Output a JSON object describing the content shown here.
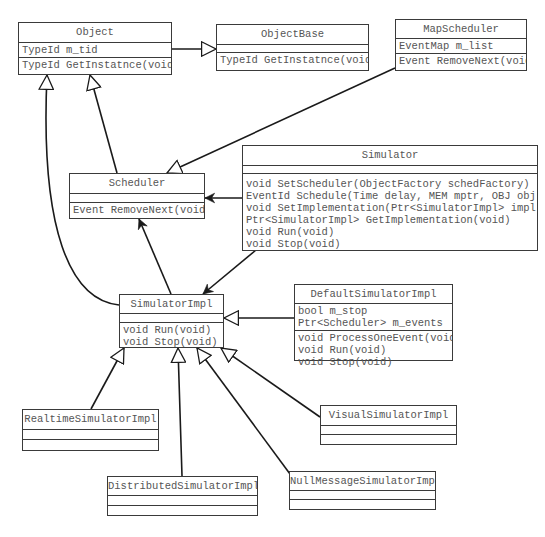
{
  "diagram": {
    "type": "UML class diagram",
    "top_cutoff_text": "",
    "classes": {
      "object": {
        "name": "Object",
        "attributes": [
          "TypeId m_tid"
        ],
        "methods": [
          "TypeId GetInstatnce(void)"
        ]
      },
      "object_base": {
        "name": "ObjectBase",
        "attributes": [],
        "methods": [
          "TypeId GetInstatnce(void)"
        ]
      },
      "map_scheduler": {
        "name": "MapScheduler",
        "attributes": [
          "EventMap m_list"
        ],
        "methods": [
          "Event RemoveNext(void)"
        ]
      },
      "scheduler": {
        "name": "Scheduler",
        "attributes": [],
        "methods": [
          "Event RemoveNext(void)"
        ]
      },
      "simulator": {
        "name": "Simulator",
        "attributes": [],
        "methods": [
          "void SetScheduler(ObjectFactory schedFactory)",
          "EventId Schedule(Time delay, MEM mptr, OBJ obj)",
          "void SetImplementation(Ptr<SimulatorImpl> impl)",
          "Ptr<SimulatorImpl> GetImplementation(void)",
          "void Run(void)",
          "void Stop(void)"
        ]
      },
      "simulator_impl": {
        "name": "SimulatorImpl",
        "attributes": [],
        "methods": [
          "void Run(void)",
          "void Stop(void)"
        ]
      },
      "default_simulator_impl": {
        "name": "DefaultSimulatorImpl",
        "attributes": [
          "bool m_stop",
          "Ptr<Scheduler> m_events"
        ],
        "methods": [
          "void ProcessOneEvent(void)",
          "void Run(void)",
          "void Stop(void)"
        ]
      },
      "realtime_simulator_impl": {
        "name": "RealtimeSimulatorImpl",
        "attributes": [],
        "methods": []
      },
      "visual_simulator_impl": {
        "name": "VisualSimulatorImpl",
        "attributes": [],
        "methods": []
      },
      "distributed_simulator_impl": {
        "name": "DistributedSimulatorImpl",
        "attributes": [],
        "methods": []
      },
      "null_message_simulator_impl": {
        "name": "NullMessageSimulatorImpl",
        "attributes": [],
        "methods": []
      }
    },
    "relations": [
      {
        "from": "Object",
        "to": "ObjectBase",
        "kind": "generalization"
      },
      {
        "from": "Scheduler",
        "to": "Object",
        "kind": "generalization"
      },
      {
        "from": "SimulatorImpl",
        "to": "Object",
        "kind": "generalization"
      },
      {
        "from": "MapScheduler",
        "to": "Scheduler",
        "kind": "generalization"
      },
      {
        "from": "Simulator",
        "to": "Scheduler",
        "kind": "association"
      },
      {
        "from": "Simulator",
        "to": "SimulatorImpl",
        "kind": "association"
      },
      {
        "from": "SimulatorImpl",
        "to": "Scheduler",
        "kind": "association"
      },
      {
        "from": "DefaultSimulatorImpl",
        "to": "SimulatorImpl",
        "kind": "generalization"
      },
      {
        "from": "RealtimeSimulatorImpl",
        "to": "SimulatorImpl",
        "kind": "generalization"
      },
      {
        "from": "DistributedSimulatorImpl",
        "to": "SimulatorImpl",
        "kind": "generalization"
      },
      {
        "from": "NullMessageSimulatorImpl",
        "to": "SimulatorImpl",
        "kind": "generalization"
      },
      {
        "from": "VisualSimulatorImpl",
        "to": "SimulatorImpl",
        "kind": "generalization"
      }
    ],
    "colors": {
      "line": "#1a1a1a",
      "box_border": "#3a3a3a",
      "text": "#555555",
      "background": "#ffffff"
    }
  }
}
